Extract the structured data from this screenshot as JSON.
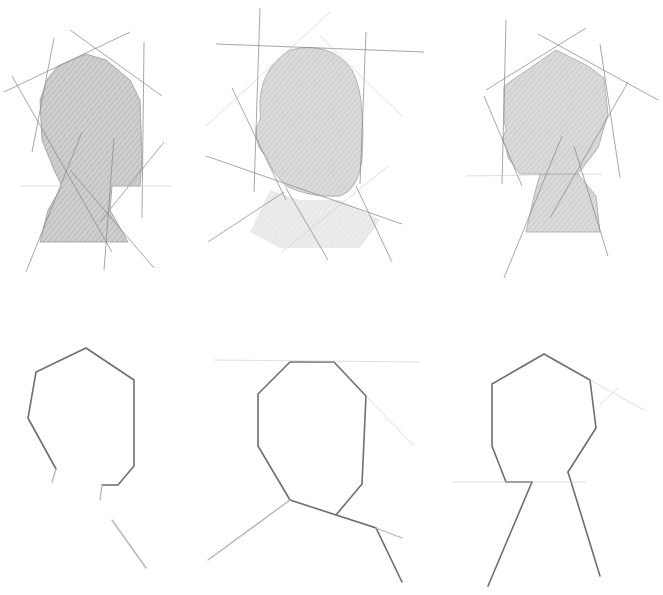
{
  "image": {
    "subject": "head-and-neck construction sketches",
    "medium": "pencil",
    "rows": [
      {
        "name": "shaded-studies",
        "panels": [
          "back-three-quarter-view",
          "back-view",
          "profile-view"
        ]
      },
      {
        "name": "outline-block-ins",
        "panels": [
          "back-three-quarter-view",
          "back-view",
          "profile-view"
        ]
      }
    ],
    "colors": {
      "paper": "#ffffff",
      "graphite_dark": "#6e6e6e",
      "graphite_light": "#c8c8c8",
      "shade": "#d2d2d2"
    }
  }
}
